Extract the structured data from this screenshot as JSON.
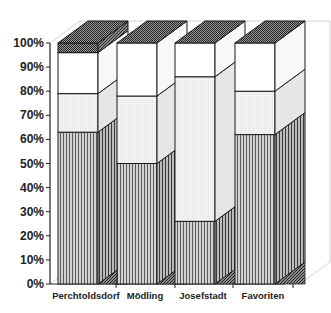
{
  "chart_data": {
    "type": "bar",
    "subtype": "3d-stacked-percent",
    "title": "",
    "xlabel": "",
    "ylabel": "",
    "ylim": [
      0,
      100
    ],
    "yticks": [
      "0%",
      "10%",
      "20%",
      "30%",
      "40%",
      "50%",
      "60%",
      "70%",
      "80%",
      "90%",
      "100%"
    ],
    "categories": [
      "Perchtoldsdorf",
      "Mödling",
      "Josefstadt",
      "Favoriten"
    ],
    "series": [
      {
        "name": "Segment 1 (vertical stripes)",
        "pattern": "vertical-stripes",
        "values": [
          63,
          50,
          26,
          62
        ]
      },
      {
        "name": "Segment 2 (light gray)",
        "pattern": "light-dots",
        "values": [
          16,
          28,
          60,
          18
        ]
      },
      {
        "name": "Segment 3 (white)",
        "pattern": "white",
        "values": [
          17,
          22,
          14,
          20
        ]
      },
      {
        "name": "Segment 4 (dark crosshatch)",
        "pattern": "dark-crosshatch",
        "values": [
          4,
          0,
          0,
          0
        ]
      }
    ],
    "legend": "none",
    "grid": false
  },
  "colors": {
    "stripes_bg": "#bdbdbd",
    "light": "#f1f1f1",
    "white": "#ffffff",
    "dark": "#555555",
    "outline": "#1a1a1a"
  }
}
